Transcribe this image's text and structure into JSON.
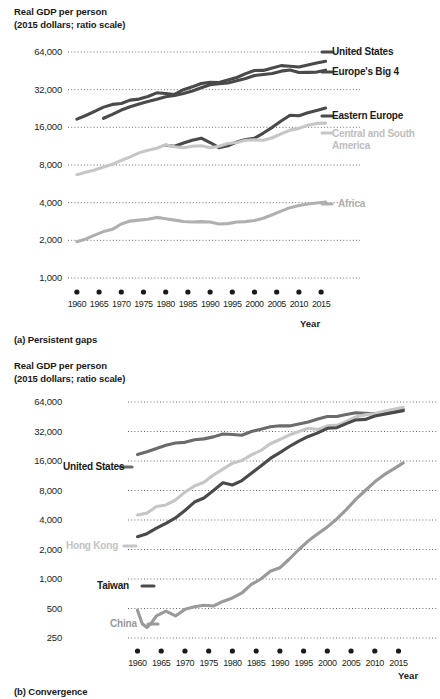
{
  "figure": {
    "axis_title_line1": "Real GDP per person",
    "axis_title_line2": "(2015 dollars; ratio scale)",
    "axis_title": "Real GDP per person\n(2015 dollars; ratio scale)",
    "x_axis_label": "Year",
    "caption_a": "(a) Persistent gaps",
    "caption_b": "(b) Convergence"
  },
  "colors": {
    "dark": "#4a4a4a",
    "darker": "#3b3b3b",
    "mid_gray": "#9a9a9a",
    "light_gray": "#c6c6c6",
    "text": "#231f20",
    "grid": "#6f6f6f"
  },
  "chart_data": [
    {
      "type": "line",
      "title": "Real GDP per person\n(2015 dollars; ratio scale)",
      "subtitle": "(a) Persistent gaps",
      "xlabel": "Year",
      "ylabel": "Real GDP per person (2015 dollars; ratio scale)",
      "yscale": "log",
      "ylim": [
        1000,
        64000
      ],
      "yticks": [
        1000,
        2000,
        4000,
        8000,
        16000,
        32000,
        64000
      ],
      "ytick_labels": [
        "1,000",
        "2,000",
        "4,000",
        "8,000",
        "16,000",
        "32,000",
        "64,000"
      ],
      "xlim": [
        1958,
        2017
      ],
      "xticks": [
        1960,
        1965,
        1970,
        1975,
        1980,
        1985,
        1990,
        1995,
        2000,
        2005,
        2010,
        2015
      ],
      "xtick_labels": [
        "1960",
        "1965",
        "1970",
        "1975",
        "1980",
        "1985",
        "1990",
        "1995",
        "2000",
        "2005",
        "2010",
        "2015"
      ],
      "grid": true,
      "legend": "inline-right",
      "series": [
        {
          "name": "United States",
          "color": "#4a4a4a",
          "label_pos": "right",
          "x": [
            1960,
            1962,
            1964,
            1966,
            1968,
            1970,
            1972,
            1974,
            1976,
            1978,
            1980,
            1982,
            1984,
            1986,
            1988,
            1990,
            1992,
            1994,
            1996,
            1998,
            2000,
            2002,
            2004,
            2006,
            2008,
            2010,
            2012,
            2014,
            2016
          ],
          "values": [
            18600,
            19900,
            21500,
            23200,
            24400,
            24800,
            26400,
            26900,
            28200,
            30200,
            29800,
            29300,
            32000,
            33700,
            35800,
            36600,
            36500,
            38200,
            40000,
            43000,
            45500,
            45600,
            47600,
            49800,
            49200,
            48500,
            50400,
            52200,
            54000
          ]
        },
        {
          "name": "Europe's Big 4",
          "color": "#4a4a4a",
          "label_pos": "right",
          "x": [
            1966,
            1968,
            1970,
            1972,
            1974,
            1976,
            1978,
            1980,
            1982,
            1984,
            1986,
            1988,
            1990,
            1992,
            1994,
            1996,
            1998,
            2000,
            2002,
            2004,
            2006,
            2008,
            2010,
            2012,
            2014,
            2016
          ],
          "values": [
            18900,
            20300,
            22000,
            23400,
            24600,
            25700,
            26800,
            28100,
            28700,
            29800,
            31200,
            33100,
            35000,
            35700,
            36200,
            37700,
            39300,
            41500,
            42300,
            43100,
            45000,
            45900,
            43900,
            44000,
            44200,
            45800
          ]
        },
        {
          "name": "Eastern Europe",
          "color": "#4a4a4a",
          "label_pos": "right",
          "x": [
            1980,
            1982,
            1984,
            1986,
            1988,
            1990,
            1992,
            1994,
            1996,
            1998,
            2000,
            2002,
            2004,
            2006,
            2008,
            2010,
            2012,
            2014,
            2016
          ],
          "values": [
            11500,
            11300,
            12000,
            12600,
            13100,
            12100,
            11000,
            11400,
            12200,
            12800,
            13100,
            14400,
            16000,
            18000,
            20000,
            19800,
            20900,
            21800,
            22800
          ]
        },
        {
          "name": "Central and South America",
          "color": "#c6c6c6",
          "label_pos": "right",
          "x": [
            1960,
            1962,
            1964,
            1966,
            1968,
            1970,
            1972,
            1974,
            1976,
            1978,
            1980,
            1982,
            1984,
            1986,
            1988,
            1990,
            1992,
            1994,
            1996,
            1998,
            2000,
            2002,
            2004,
            2006,
            2008,
            2010,
            2012,
            2014,
            2016
          ],
          "values": [
            6700,
            7000,
            7300,
            7700,
            8100,
            8700,
            9300,
            10000,
            10500,
            10900,
            11600,
            11200,
            11000,
            11300,
            11400,
            11000,
            11300,
            11900,
            12100,
            12600,
            12700,
            12600,
            13200,
            14200,
            15200,
            15700,
            16600,
            17200,
            17300
          ]
        },
        {
          "name": "Africa",
          "color": "#b0b0b0",
          "label_pos": "right",
          "x": [
            1960,
            1962,
            1964,
            1966,
            1968,
            1970,
            1972,
            1974,
            1976,
            1978,
            1980,
            1982,
            1984,
            1986,
            1988,
            1990,
            1992,
            1994,
            1996,
            1998,
            2000,
            2002,
            2004,
            2006,
            2008,
            2010,
            2012,
            2014,
            2016
          ],
          "values": [
            1950,
            2050,
            2200,
            2350,
            2450,
            2700,
            2850,
            2900,
            2950,
            3050,
            2980,
            2900,
            2830,
            2800,
            2820,
            2800,
            2700,
            2720,
            2800,
            2820,
            2880,
            3000,
            3200,
            3420,
            3650,
            3800,
            3900,
            3980,
            4050
          ]
        }
      ]
    },
    {
      "type": "line",
      "title": "Real GDP per person\n(2015 dollars; ratio scale)",
      "subtitle": "(b) Convergence",
      "xlabel": "Year",
      "ylabel": "Real GDP per person (2015 dollars; ratio scale)",
      "yscale": "log",
      "ylim": [
        250,
        64000
      ],
      "yticks": [
        250,
        500,
        1000,
        2000,
        4000,
        8000,
        16000,
        32000,
        64000
      ],
      "ytick_labels": [
        "250",
        "500",
        "1,000",
        "2,000",
        "4,000",
        "8,000",
        "16,000",
        "32,000",
        "64,000"
      ],
      "xlim": [
        1958,
        2017
      ],
      "xticks": [
        1960,
        1965,
        1970,
        1975,
        1980,
        1985,
        1990,
        1995,
        2000,
        2005,
        2010,
        2015
      ],
      "xtick_labels": [
        "1960",
        "1965",
        "1970",
        "1975",
        "1980",
        "1985",
        "1990",
        "1995",
        "2000",
        "2005",
        "2010",
        "2015"
      ],
      "grid": true,
      "legend": "inline-left",
      "series": [
        {
          "name": "United States",
          "color": "#6b6b6b",
          "label_pos": "left",
          "x": [
            1960,
            1962,
            1964,
            1966,
            1968,
            1970,
            1972,
            1974,
            1976,
            1978,
            1980,
            1982,
            1984,
            1986,
            1988,
            1990,
            1992,
            1994,
            1996,
            1998,
            2000,
            2002,
            2004,
            2006,
            2008,
            2010,
            2012,
            2014,
            2016
          ],
          "values": [
            18600,
            19900,
            21500,
            23200,
            24400,
            24800,
            26400,
            26900,
            28200,
            30200,
            29800,
            29300,
            32000,
            33700,
            35800,
            36600,
            36500,
            38200,
            40000,
            43000,
            45500,
            45600,
            47600,
            49800,
            49200,
            48500,
            50400,
            52200,
            54000
          ]
        },
        {
          "name": "Hong Kong",
          "color": "#c6c6c6",
          "label_pos": "left",
          "x": [
            1960,
            1962,
            1964,
            1966,
            1968,
            1970,
            1972,
            1974,
            1976,
            1978,
            1980,
            1982,
            1984,
            1986,
            1988,
            1990,
            1992,
            1994,
            1996,
            1998,
            2000,
            2002,
            2004,
            2006,
            2008,
            2010,
            2012,
            2014,
            2016
          ],
          "values": [
            4500,
            4700,
            5500,
            5700,
            6400,
            7700,
            8900,
            9700,
            11500,
            13200,
            15200,
            16200,
            18500,
            20500,
            24000,
            26500,
            29500,
            32000,
            34500,
            33500,
            36500,
            37000,
            40500,
            45000,
            47500,
            48500,
            51500,
            54000,
            56500
          ]
        },
        {
          "name": "Taiwan",
          "color": "#4a4a4a",
          "label_pos": "left",
          "x": [
            1960,
            1962,
            1964,
            1966,
            1968,
            1970,
            1972,
            1974,
            1976,
            1978,
            1980,
            1982,
            1984,
            1986,
            1988,
            1990,
            1992,
            1994,
            1996,
            1998,
            2000,
            2002,
            2004,
            2006,
            2008,
            2010,
            2012,
            2014,
            2016
          ],
          "values": [
            2700,
            2900,
            3300,
            3700,
            4200,
            5000,
            6100,
            6700,
            8000,
            9600,
            9100,
            10100,
            12000,
            14200,
            17000,
            19500,
            22500,
            25500,
            28500,
            31000,
            34500,
            35000,
            38500,
            42000,
            42500,
            46000,
            48000,
            50000,
            52000
          ]
        },
        {
          "name": "China",
          "color": "#9a9a9a",
          "label_pos": "left",
          "x": [
            1960,
            1961,
            1962,
            1963,
            1964,
            1966,
            1968,
            1970,
            1972,
            1974,
            1976,
            1978,
            1980,
            1982,
            1984,
            1986,
            1988,
            1990,
            1992,
            1994,
            1996,
            1998,
            2000,
            2002,
            2004,
            2006,
            2008,
            2010,
            2012,
            2014,
            2016
          ],
          "values": [
            480,
            350,
            320,
            360,
            420,
            470,
            420,
            490,
            520,
            540,
            530,
            590,
            640,
            720,
            880,
            1000,
            1200,
            1300,
            1600,
            2000,
            2450,
            2900,
            3400,
            4100,
            5100,
            6500,
            8000,
            9800,
            11600,
            13300,
            15300
          ]
        }
      ]
    }
  ]
}
